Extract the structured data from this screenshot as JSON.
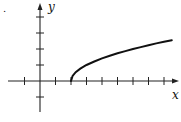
{
  "chart_data": {
    "type": "line",
    "title": "",
    "xlabel": "x",
    "ylabel": "y",
    "function": "y = sqrt(x - 2)",
    "xlim": [
      -1.5,
      9
    ],
    "ylim": [
      -2,
      4
    ],
    "x_ticks": [
      -1,
      1,
      2,
      3,
      4,
      5,
      6,
      7,
      8
    ],
    "y_ticks": [
      -1,
      1,
      2,
      3,
      4
    ],
    "tick_labels_shown": false,
    "grid": false,
    "legend": null,
    "series": [
      {
        "name": "curve",
        "x": [
          2,
          2.1,
          2.3,
          2.6,
          3,
          3.5,
          4,
          4.5,
          5,
          5.5,
          6,
          6.5,
          7,
          7.5,
          8,
          8.5
        ],
        "y": [
          0,
          0.32,
          0.55,
          0.77,
          1.0,
          1.22,
          1.41,
          1.58,
          1.73,
          1.87,
          2.0,
          2.12,
          2.24,
          2.35,
          2.45,
          2.55
        ]
      }
    ],
    "annotations": [
      "."
    ]
  },
  "labels": {
    "x_axis": "x",
    "y_axis": "y",
    "stray_mark": "."
  },
  "layout": {
    "origin_px": [
      40,
      81
    ],
    "x_unit_px": 15.5,
    "y_unit_px": 16
  }
}
